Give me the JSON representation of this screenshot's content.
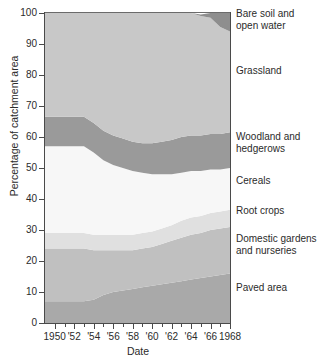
{
  "chart_data": {
    "type": "area",
    "title": "",
    "xlabel": "Date",
    "ylabel": "Percentage of catchment area",
    "xlim": [
      1949,
      1968
    ],
    "ylim": [
      0,
      100
    ],
    "grid": false,
    "stacked": true,
    "legend_position": "right",
    "x": [
      1949,
      1950,
      1951,
      1952,
      1953,
      1954,
      1955,
      1956,
      1957,
      1958,
      1959,
      1960,
      1961,
      1962,
      1963,
      1964,
      1965,
      1966,
      1967,
      1968
    ],
    "x_tick_labels": [
      "1950",
      "'52",
      "'54",
      "'56",
      "'58",
      "'60",
      "'62",
      "'64",
      "'66",
      "1968"
    ],
    "x_tick_values": [
      1950,
      1952,
      1954,
      1956,
      1958,
      1960,
      1962,
      1964,
      1966,
      1968
    ],
    "y_tick_labels": [
      "0",
      "10",
      "20",
      "30",
      "40",
      "50",
      "60",
      "70",
      "80",
      "90",
      "100"
    ],
    "y_tick_values": [
      0,
      10,
      20,
      30,
      40,
      50,
      60,
      70,
      80,
      90,
      100
    ],
    "series": [
      {
        "name": "Paved area",
        "color": "#a9a9a9",
        "values": [
          7,
          7,
          7,
          7,
          7,
          7.5,
          9,
          10,
          10.5,
          11,
          11.5,
          12,
          12.5,
          13,
          13.5,
          14,
          14.5,
          15,
          15.5,
          16
        ]
      },
      {
        "name": "Domestic gardens and nurseries",
        "color": "#c0c0c0",
        "values": [
          17,
          17,
          17,
          17,
          17,
          16,
          14.5,
          13.5,
          13,
          12.5,
          12.5,
          12.5,
          13,
          13.5,
          14,
          14.5,
          14.5,
          15,
          15,
          15
        ]
      },
      {
        "name": "Root crops",
        "color": "#e0e0e0",
        "values": [
          5,
          5,
          5,
          5,
          5,
          5,
          5,
          5,
          5,
          5,
          5,
          5,
          5,
          5,
          5.5,
          5.5,
          5.5,
          5.5,
          5.5,
          5.5
        ]
      },
      {
        "name": "Cereals",
        "color": "#f7f7f7",
        "values": [
          28,
          28,
          28,
          28,
          28,
          26.5,
          24,
          22.5,
          21.5,
          20.5,
          19.5,
          18.5,
          17.5,
          16.5,
          15.5,
          15,
          14.5,
          14,
          13.5,
          13.5
        ]
      },
      {
        "name": "Woodland and hedgerows",
        "color": "#9a9a9a",
        "values": [
          9.5,
          9.5,
          9.5,
          9.5,
          9.5,
          9.5,
          9.5,
          9.5,
          9.5,
          9.5,
          9.5,
          10,
          10.5,
          11,
          11.5,
          11.5,
          11.5,
          11.5,
          11.5,
          11.5
        ]
      },
      {
        "name": "Grassland",
        "color": "#c8c8c8",
        "values": [
          33.5,
          33.5,
          33.5,
          33.5,
          33.5,
          35.5,
          38,
          39.5,
          40.5,
          41.5,
          42,
          42,
          41.5,
          41,
          40,
          39.5,
          38.5,
          37.5,
          34.5,
          32.5
        ]
      },
      {
        "name": "Bare soil and open water",
        "color": "#8e8e8e",
        "values": [
          0,
          0,
          0,
          0,
          0,
          0,
          0,
          0,
          0,
          0,
          0,
          0,
          0,
          0,
          0,
          0,
          0.5,
          1.5,
          4.5,
          6.5
        ]
      }
    ],
    "cumulative_boundaries": {
      "note": "Cumulative stacked tops, bottom-up, percent of catchment area",
      "paved_top": [
        7,
        7,
        7,
        7,
        7,
        7.5,
        9,
        10,
        10.5,
        11,
        11.5,
        12,
        12.5,
        13,
        13.5,
        14,
        14.5,
        15,
        15.5,
        16
      ],
      "gardens_top": [
        24,
        24,
        24,
        24,
        24,
        23.5,
        23.5,
        23.5,
        23.5,
        23.5,
        24,
        24.5,
        25.5,
        26.5,
        27.5,
        28.5,
        29,
        30,
        30.5,
        31
      ],
      "rootcrops_top": [
        29,
        29,
        29,
        29,
        29,
        28.5,
        28.5,
        28.5,
        28.5,
        28.5,
        29,
        29.5,
        30.5,
        31.5,
        33,
        34,
        34.5,
        35.5,
        36,
        36.5
      ],
      "cereals_top": [
        57,
        57,
        57,
        57,
        57,
        55,
        52.5,
        51,
        50,
        49,
        48.5,
        48,
        48,
        48,
        48.5,
        49,
        49,
        49.5,
        49.5,
        50
      ],
      "woodland_top": [
        66.5,
        66.5,
        66.5,
        66.5,
        66.5,
        64.5,
        62,
        60.5,
        59.5,
        58.5,
        58,
        58,
        58.5,
        59,
        60,
        60.5,
        60.5,
        61,
        61,
        61.5
      ],
      "grassland_top": [
        100,
        100,
        100,
        100,
        100,
        100,
        100,
        100,
        100,
        100,
        100,
        100,
        100,
        100,
        100,
        100,
        99,
        98.5,
        95.5,
        94
      ],
      "baresoil_top": [
        100,
        100,
        100,
        100,
        100,
        100,
        100,
        100,
        100,
        100,
        100,
        100,
        100,
        100,
        100,
        100,
        100,
        100,
        100,
        100
      ]
    }
  },
  "axes": {
    "y_title": "Percentage of catchment area",
    "x_title": "Date",
    "y_ticks": [
      "100",
      "90",
      "80",
      "70",
      "60",
      "50",
      "40",
      "30",
      "20",
      "10",
      "0"
    ],
    "x_ticks": [
      "1950",
      "'52",
      "'54",
      "'56",
      "'58",
      "'60",
      "'62",
      "'64",
      "'66",
      "1968"
    ]
  },
  "legend": {
    "items": [
      {
        "label_line1": "Bare soil and",
        "label_line2": "open water"
      },
      {
        "label_line1": "Grassland",
        "label_line2": ""
      },
      {
        "label_line1": "Woodland and",
        "label_line2": "hedgerows"
      },
      {
        "label_line1": "Cereals",
        "label_line2": ""
      },
      {
        "label_line1": "Root crops",
        "label_line2": ""
      },
      {
        "label_line1": "Domestic gardens",
        "label_line2": "and nurseries"
      },
      {
        "label_line1": "Paved area",
        "label_line2": ""
      }
    ]
  }
}
